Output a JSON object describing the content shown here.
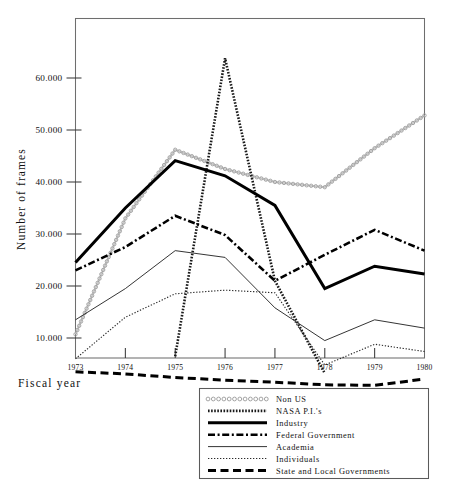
{
  "chart_data": {
    "type": "line",
    "title": "",
    "xlabel": "Fiscal year",
    "ylabel": "Number of frames",
    "categories": [
      "1973",
      "1974",
      "1975",
      "1976",
      "1977",
      "1978",
      "1979",
      "1980"
    ],
    "x": [
      1973,
      1974,
      1975,
      1976,
      1977,
      1978,
      1979,
      1980
    ],
    "xlim": [
      1973,
      1980
    ],
    "ylim": [
      0,
      70000
    ],
    "yticks": [
      10000,
      20000,
      30000,
      40000,
      50000,
      60000
    ],
    "ytick_labels": [
      "10.000",
      "20.000",
      "30.000",
      "40.000",
      "50.000",
      "60.000"
    ],
    "grid": false,
    "legend_position": "below-right",
    "series": [
      {
        "name": "Non US",
        "style": "circles",
        "color": "#bdbdbd",
        "values": [
          10700,
          33000,
          46200,
          42500,
          40000,
          39000,
          46500,
          52800
        ]
      },
      {
        "name": "NASA P.I.'s",
        "style": "dense-dotted",
        "color": "#1a1a1a",
        "values": [
          null,
          null,
          6500,
          63800,
          21000,
          3200,
          null,
          null
        ]
      },
      {
        "name": "Industry",
        "style": "thick-solid",
        "color": "#000000",
        "values": [
          24500,
          35000,
          44100,
          41200,
          35500,
          19500,
          23800,
          22300
        ]
      },
      {
        "name": "Federal Government",
        "style": "dash-dot",
        "color": "#000000",
        "values": [
          23000,
          27500,
          33500,
          29800,
          21000,
          26000,
          30800,
          26800
        ]
      },
      {
        "name": "Academia",
        "style": "thin-solid",
        "color": "#2a2a2a",
        "values": [
          13500,
          19500,
          26800,
          25500,
          15800,
          9500,
          13500,
          11900
        ]
      },
      {
        "name": "Individuals",
        "style": "fine-dotted",
        "color": "#2a2a2a",
        "values": [
          6000,
          14000,
          18500,
          19200,
          18700,
          4800,
          8800,
          7400
        ]
      },
      {
        "name": "State and Local Governments",
        "style": "thick-dashed",
        "color": "#000000",
        "values": [
          3500,
          3100,
          2400,
          1900,
          1500,
          1000,
          900,
          2100
        ]
      }
    ]
  },
  "axes": {
    "ylabel": "Number of frames",
    "xlabel": "Fiscal year",
    "ytick_labels": [
      "60.000",
      "50.000",
      "40.000",
      "30.000",
      "20.000",
      "10.000"
    ],
    "xtick_labels": [
      "1973",
      "1974",
      "1975",
      "1976",
      "1977",
      "1978",
      "1979",
      "1980"
    ]
  },
  "legend": {
    "entries": [
      {
        "label": "Non US",
        "style": "circles"
      },
      {
        "label": "NASA P.I.'s",
        "style": "dense-dotted"
      },
      {
        "label": "Industry",
        "style": "thick-solid"
      },
      {
        "label": "Federal Government",
        "style": "dash-dot"
      },
      {
        "label": "Academia",
        "style": "thin-solid"
      },
      {
        "label": "Individuals",
        "style": "fine-dotted"
      },
      {
        "label": "State and Local Governments",
        "style": "thick-dashed"
      }
    ]
  }
}
